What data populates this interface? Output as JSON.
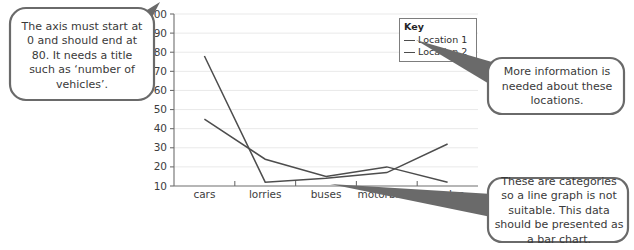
{
  "chart_data": {
    "type": "line",
    "title": "",
    "xlabel": "",
    "ylabel": "",
    "categories": [
      "cars",
      "lorries",
      "buses",
      "motorbikes",
      "cycles"
    ],
    "series": [
      {
        "name": "Location 1",
        "values": [
          45,
          24,
          15,
          20,
          12
        ]
      },
      {
        "name": "Location 2",
        "values": [
          78,
          12,
          14,
          17,
          32
        ]
      }
    ],
    "ylim": [
      10,
      100
    ],
    "ytick_labels": [
      "10",
      "20",
      "30",
      "40",
      "50",
      "60",
      "70",
      "80",
      "90",
      "100"
    ],
    "ytick_values": [
      10,
      20,
      30,
      40,
      50,
      60,
      70,
      80,
      90,
      100
    ],
    "grid": true,
    "legend_position": "top-right",
    "line_color": "#4d4d4d",
    "grid_color": "#e9e9e9",
    "axis_color": "#6e6e6e"
  },
  "legend": {
    "title": "Key",
    "entries": [
      {
        "label": "Location 1"
      },
      {
        "label": "Location 2"
      }
    ]
  },
  "callouts": [
    {
      "id": "axis",
      "text": "The axis must start at 0 and should end at 80. It needs a title such as ‘number of vehicles’."
    },
    {
      "id": "locations",
      "text": "More information is needed about these locations."
    },
    {
      "id": "categories",
      "text": "These are categories so a line graph is not suitable. This data should be presented as a bar chart."
    }
  ],
  "colors": {
    "bubble_stroke": "#6a6a6a",
    "bubble_fill": "#ffffff",
    "text": "#3a3a3a",
    "background": "#ffffff"
  }
}
